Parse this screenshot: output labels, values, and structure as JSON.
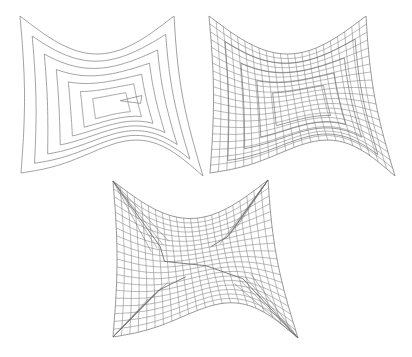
{
  "figure": {
    "width": 412,
    "height": 357,
    "background": "#ffffff",
    "stroke_color": "#8a8a8a",
    "dark_stroke_color": "#6e6e6e",
    "panels": [
      {
        "id": "spiral-toolpath",
        "description": "Concentric spiral contour offset curves on a warped quadrilateral domain",
        "corners": {
          "tl": [
            20,
            16
          ],
          "tr": [
            174,
            16
          ],
          "bl": [
            21,
            173
          ],
          "br": [
            203,
            176
          ]
        },
        "rings": 7,
        "inner_triangle": true
      },
      {
        "id": "quad-mesh-spiral",
        "description": "Structured quadrilateral mesh following spiral layers",
        "corners": {
          "tl": [
            209,
            16
          ],
          "tr": [
            366,
            16
          ],
          "bl": [
            210,
            173
          ],
          "br": [
            395,
            176
          ]
        },
        "grid_cols": 22,
        "grid_rows": 20
      },
      {
        "id": "quad-mesh-with-singularities",
        "description": "Quadrilateral mesh with diagonal singular seams from corners to interior",
        "corners": {
          "tl": [
            113,
            181
          ],
          "tr": [
            268,
            180
          ],
          "bl": [
            113,
            337
          ],
          "br": [
            298,
            338
          ]
        },
        "grid_cols": 22,
        "grid_rows": 20
      }
    ]
  }
}
